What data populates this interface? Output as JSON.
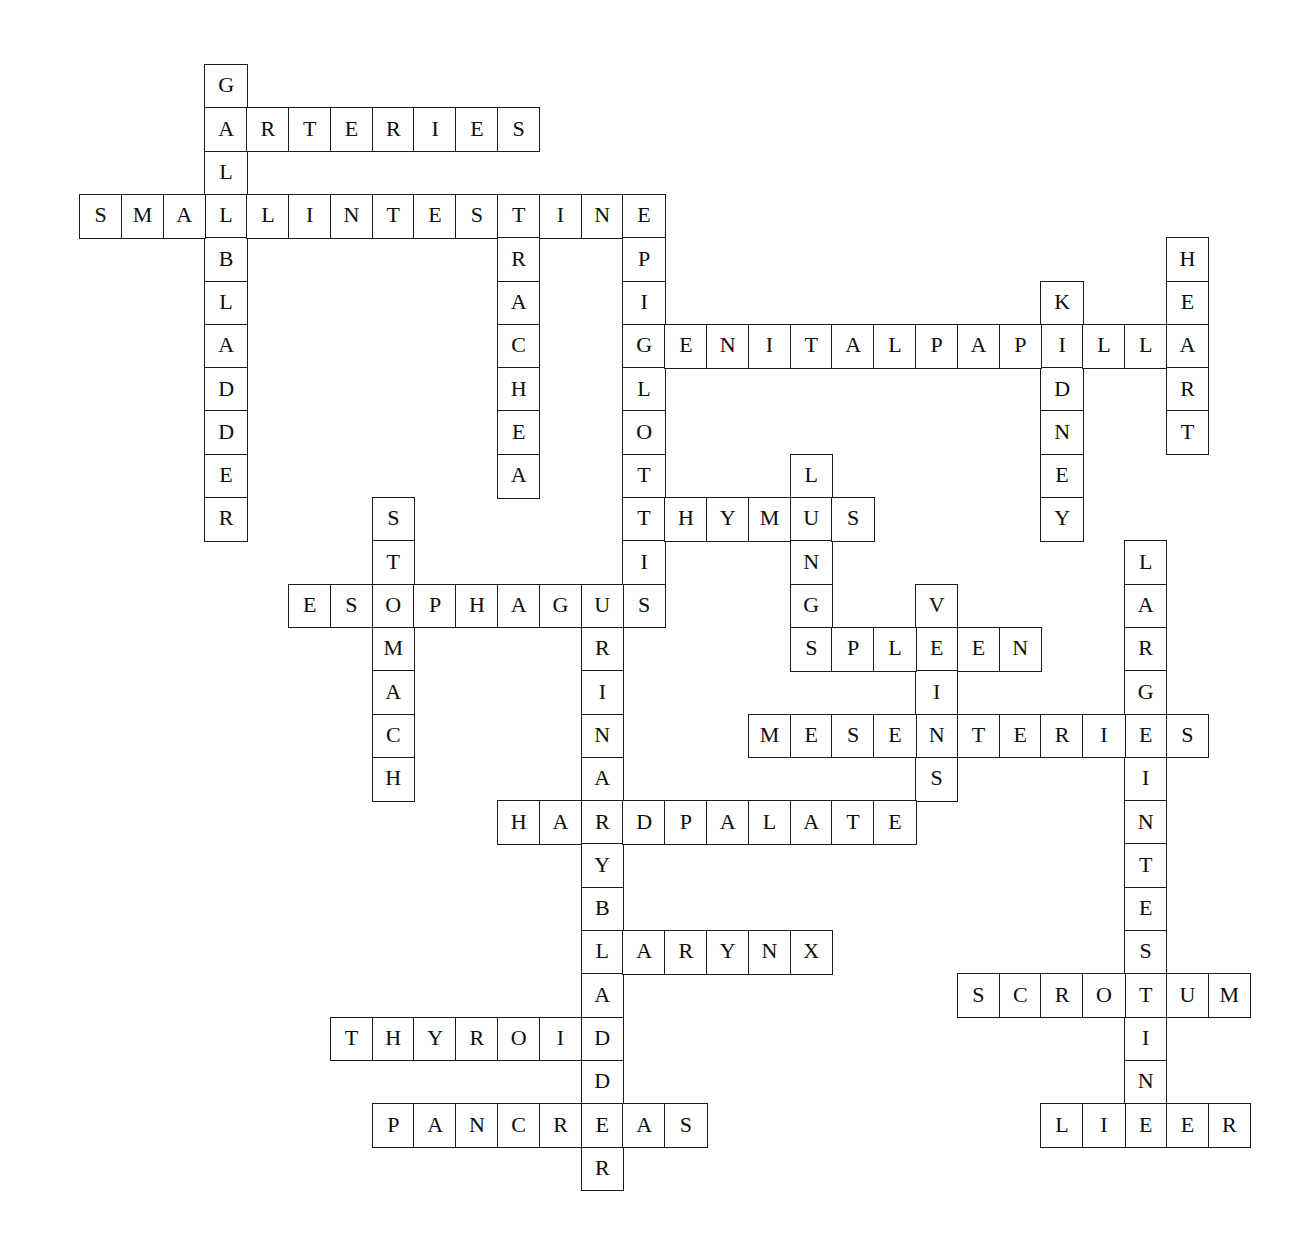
{
  "puzzle": {
    "title": "Anatomy Crossword Puzzle",
    "theme": "human body organs and systems",
    "grid": {
      "origin_x": 79,
      "origin_y": 64,
      "cell_w": 41.8,
      "cell_h": 43.3,
      "cols": 28,
      "rows": 26,
      "border_color": "#1a1a1a",
      "cell_background": "#ffffff",
      "page_background": "#ffffff"
    },
    "entries": [
      {
        "answer": "GALLBLADDER",
        "direction": "down",
        "row": 0,
        "col": 3,
        "length": 11
      },
      {
        "answer": "ARTERIES",
        "direction": "across",
        "row": 1,
        "col": 3,
        "length": 8
      },
      {
        "answer": "SMALLINTESTINE",
        "direction": "across",
        "row": 3,
        "col": 0,
        "length": 14
      },
      {
        "answer": "TRACHEA",
        "direction": "down",
        "row": 3,
        "col": 10,
        "length": 7
      },
      {
        "answer": "EPIGLOTTIS",
        "direction": "down",
        "row": 3,
        "col": 13,
        "length": 10
      },
      {
        "answer": "HEART",
        "direction": "down",
        "row": 4,
        "col": 26,
        "length": 5
      },
      {
        "answer": "KIDNEY",
        "direction": "down",
        "row": 5,
        "col": 23,
        "length": 6
      },
      {
        "answer": "GENITALPAPILLA",
        "direction": "across",
        "row": 6,
        "col": 13,
        "length": 14
      },
      {
        "answer": "LUNGS",
        "direction": "down",
        "row": 9,
        "col": 17,
        "length": 5
      },
      {
        "answer": "STOMACH",
        "direction": "down",
        "row": 10,
        "col": 7,
        "length": 7
      },
      {
        "answer": "THYMUS",
        "direction": "across",
        "row": 10,
        "col": 13,
        "length": 6
      },
      {
        "answer": "LARGEINTESTINE",
        "direction": "down",
        "row": 11,
        "col": 25,
        "length": 14
      },
      {
        "answer": "ESOPHAGUS",
        "direction": "across",
        "row": 12,
        "col": 5,
        "length": 9
      },
      {
        "answer": "URINARYBLADDER",
        "direction": "down",
        "row": 12,
        "col": 12,
        "length": 14
      },
      {
        "answer": "VEINS",
        "direction": "down",
        "row": 12,
        "col": 20,
        "length": 5
      },
      {
        "answer": "SPLEEN",
        "direction": "across",
        "row": 13,
        "col": 17,
        "length": 6
      },
      {
        "answer": "MESENTERIES",
        "direction": "across",
        "row": 15,
        "col": 16,
        "length": 11
      },
      {
        "answer": "HARDPALATE",
        "direction": "across",
        "row": 17,
        "col": 10,
        "length": 10
      },
      {
        "answer": "LARYNX",
        "direction": "across",
        "row": 20,
        "col": 12,
        "length": 6
      },
      {
        "answer": "SCROTUM",
        "direction": "across",
        "row": 21,
        "col": 21,
        "length": 7
      },
      {
        "answer": "THYROID",
        "direction": "across",
        "row": 22,
        "col": 6,
        "length": 7
      },
      {
        "answer": "PANCREAS",
        "direction": "across",
        "row": 24,
        "col": 7,
        "length": 8
      },
      {
        "answer": "LIVER",
        "direction": "across",
        "row": 24,
        "col": 23,
        "length": 5
      }
    ]
  }
}
